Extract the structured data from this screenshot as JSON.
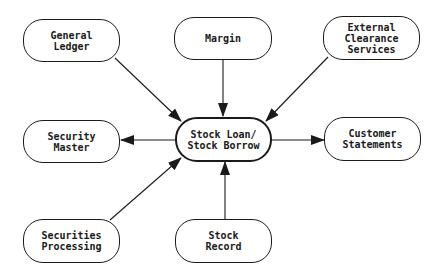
{
  "diagram": {
    "type": "hub-and-spoke flow diagram",
    "center": {
      "id": "sl",
      "lines": [
        "Stock Loan/",
        "Stock Borrow"
      ]
    },
    "nodes": [
      {
        "id": "gl",
        "lines": [
          "General",
          "Ledger"
        ]
      },
      {
        "id": "margin",
        "lines": [
          "Margin"
        ]
      },
      {
        "id": "ecs",
        "lines": [
          "External",
          "Clearance",
          "Services"
        ]
      },
      {
        "id": "sm",
        "lines": [
          "Security",
          "Master"
        ]
      },
      {
        "id": "cs",
        "lines": [
          "Customer",
          "Statements"
        ]
      },
      {
        "id": "sp",
        "lines": [
          "Securities",
          "Processing"
        ]
      },
      {
        "id": "sr",
        "lines": [
          "Stock",
          "Record"
        ]
      }
    ],
    "edges": [
      {
        "from": "General Ledger",
        "to": "Stock Loan/Stock Borrow"
      },
      {
        "from": "Margin",
        "to": "Stock Loan/Stock Borrow"
      },
      {
        "from": "External Clearance Services",
        "to": "Stock Loan/Stock Borrow"
      },
      {
        "from": "Stock Loan/Stock Borrow",
        "to": "Security Master"
      },
      {
        "from": "Stock Loan/Stock Borrow",
        "to": "Customer Statements"
      },
      {
        "from": "Securities Processing",
        "to": "Stock Loan/Stock Borrow"
      },
      {
        "from": "Stock Record",
        "to": "Stock Loan/Stock Borrow"
      }
    ],
    "colors": {
      "stroke": "#1a1a1a",
      "background": "#ffffff"
    }
  }
}
